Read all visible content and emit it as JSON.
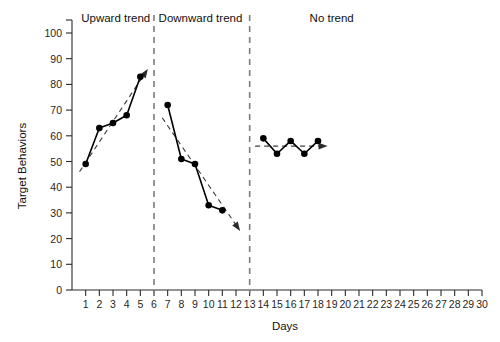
{
  "chart_data": {
    "type": "line",
    "title": "",
    "xlabel": "Days",
    "ylabel": "Target Behaviors",
    "xlim": [
      0,
      30
    ],
    "ylim": [
      0,
      100
    ],
    "y_ticks": [
      0,
      10,
      20,
      30,
      40,
      50,
      60,
      70,
      80,
      90,
      100
    ],
    "x_ticks": [
      1,
      2,
      3,
      4,
      5,
      6,
      7,
      8,
      9,
      10,
      11,
      12,
      13,
      14,
      15,
      16,
      17,
      18,
      19,
      20,
      21,
      22,
      23,
      24,
      25,
      26,
      27,
      28,
      29,
      30
    ],
    "grid": false,
    "legend": "none",
    "phase_dividers": [
      6,
      13
    ],
    "phases": [
      {
        "label": "Upward trend",
        "label_x": 3.2,
        "x_range": [
          0,
          6
        ],
        "trend": {
          "x": [
            0.55,
            5.55
          ],
          "y": [
            46,
            86
          ]
        },
        "x": [
          1,
          2,
          3,
          4,
          5
        ],
        "y": [
          49,
          63,
          65,
          68,
          83
        ]
      },
      {
        "label": "Downward trend",
        "label_x": 9.4,
        "x_range": [
          6,
          13
        ],
        "trend": {
          "x": [
            6.6,
            12.3
          ],
          "y": [
            67,
            23
          ]
        },
        "x": [
          7,
          8,
          9,
          10,
          11
        ],
        "y": [
          72,
          51,
          49,
          33,
          31
        ]
      },
      {
        "label": "No trend",
        "label_x": 19.0,
        "x_range": [
          13,
          30
        ],
        "trend": {
          "x": [
            13.4,
            18.7
          ],
          "y": [
            56,
            56
          ]
        },
        "x": [
          14,
          15,
          16,
          17,
          18
        ],
        "y": [
          59,
          53,
          58,
          53,
          58
        ]
      }
    ]
  },
  "axes": {
    "y_axis_title": "Target Behaviors",
    "x_axis_title": "Days",
    "y_tick_labels": [
      "0",
      "10",
      "20",
      "30",
      "40",
      "50",
      "60",
      "70",
      "80",
      "90",
      "100"
    ],
    "x_tick_labels": [
      "1",
      "2",
      "3",
      "4",
      "5",
      "6",
      "7",
      "8",
      "9",
      "10",
      "11",
      "12",
      "13",
      "14",
      "15",
      "16",
      "17",
      "18",
      "19",
      "20",
      "21",
      "22",
      "23",
      "24",
      "25",
      "26",
      "27",
      "28",
      "29",
      "30"
    ]
  },
  "phase_labels": {
    "upward": "Upward trend",
    "downward": "Downward trend",
    "none": "No trend"
  },
  "colors": {
    "data_line": "#000000",
    "trend_line": "#3c3c3c",
    "divider": "#7d7d7d",
    "axis": "#2a2a2a",
    "background": "#ffffff"
  }
}
